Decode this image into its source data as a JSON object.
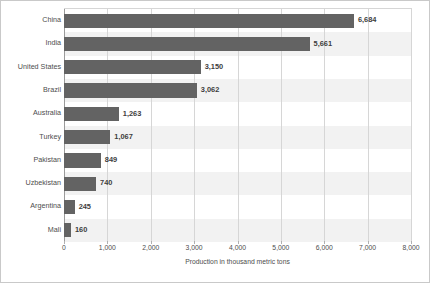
{
  "chart_data": {
    "type": "bar",
    "orientation": "horizontal",
    "title": "",
    "xlabel": "Production in thousand metric tons",
    "ylabel": "",
    "categories": [
      "China",
      "India",
      "United States",
      "Brazil",
      "Australia",
      "Turkey",
      "Pakistan",
      "Uzbekistan",
      "Argentina",
      "Mali"
    ],
    "values": [
      6684,
      5661,
      3150,
      3062,
      1263,
      1067,
      849,
      740,
      245,
      160
    ],
    "value_labels": [
      "6,684",
      "5,661",
      "3,150",
      "3,062",
      "1,263",
      "1,067",
      "849",
      "740",
      "245",
      "160"
    ],
    "xlim": [
      0,
      8000
    ],
    "xticks": [
      0,
      1000,
      2000,
      3000,
      4000,
      5000,
      6000,
      7000,
      8000
    ],
    "xtick_labels": [
      "0",
      "1,000",
      "2,000",
      "3,000",
      "4,000",
      "5,000",
      "6,000",
      "7,000",
      "8,000"
    ],
    "grid": "vertical",
    "legend": "none",
    "colors": {
      "bar": "#636363",
      "band": "#f2f2f2",
      "gridline": "#d6d6d6",
      "axis": "#9a9a9a",
      "text": "#4d4d4d",
      "value_text": "#3d3d3d",
      "border": "#c9c9c9",
      "background": "#ffffff"
    }
  }
}
